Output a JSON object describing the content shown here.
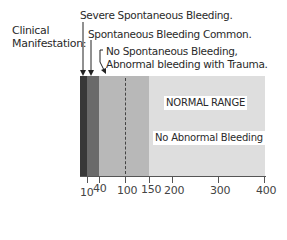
{
  "heading": {
    "line1": "Clinical",
    "line2": "Manifestation:"
  },
  "annotations": [
    {
      "text": "Severe Spontaneous Bleeding."
    },
    {
      "text": "Spontaneous Bleeding Common."
    },
    {
      "line1": "No Spontaneous Bleeding,",
      "line2": "Abnormal bleeding with Trauma."
    }
  ],
  "bands": [
    {
      "from": 0,
      "to": 10,
      "color": "#383838"
    },
    {
      "from": 10,
      "to": 40,
      "color": "#6a6a6a"
    },
    {
      "from": 40,
      "to": 150,
      "color": "#b8b8b8"
    },
    {
      "from": 150,
      "to": 400,
      "color": "#dedede"
    }
  ],
  "dashed_marker": 100,
  "range_label": "NORMAL RANGE",
  "region_label": "No Abnormal Bleeding",
  "axis": {
    "ticks": [
      "10",
      "40",
      "100",
      "150",
      "200",
      "300",
      "400"
    ]
  },
  "colors": {
    "text": "#2a2a2a",
    "axis": "#555555"
  }
}
